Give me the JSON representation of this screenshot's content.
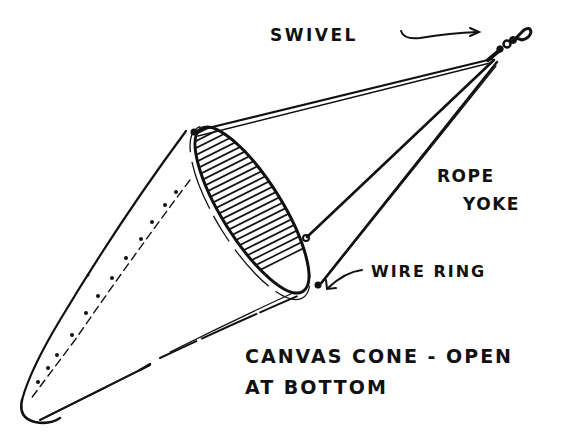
{
  "diagram": {
    "type": "hand-drawn illustration",
    "colors": {
      "ink": "#111111",
      "background": "#ffffff"
    },
    "labels": {
      "swivel": "SWIVEL",
      "rope": "ROPE",
      "yoke": "YOKE",
      "wire_ring": "WIRE RING",
      "canvas_line1": "CANVAS CONE - OPEN",
      "canvas_line2": "AT BOTTOM"
    },
    "parts": [
      {
        "name": "swivel",
        "description": "swivel fitting at apex of yoke"
      },
      {
        "name": "rope-yoke",
        "description": "three ropes from swivel to wire ring"
      },
      {
        "name": "wire-ring",
        "description": "elliptical ring at cone mouth, hatched opening"
      },
      {
        "name": "canvas-cone",
        "description": "tapered canvas cone with stitched seam, open at bottom"
      }
    ]
  }
}
